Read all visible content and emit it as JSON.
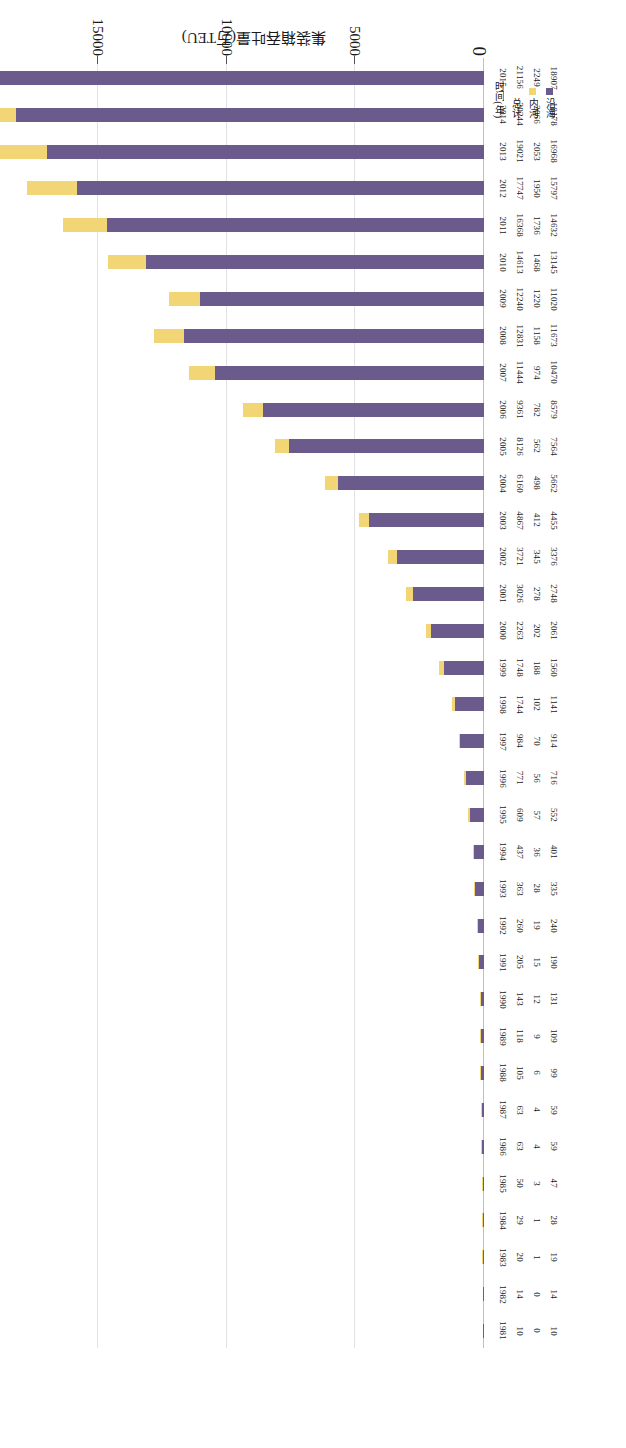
{
  "chart_data": {
    "type": "bar",
    "orientation": "horizontal-stacked",
    "title": "",
    "xlabel": "集装箱吞吐量(万TEU)",
    "ylabel": "时间(年)",
    "xlim": [
      0,
      22000
    ],
    "ticks": [
      "0",
      "5000",
      "10000",
      "15000",
      "20000"
    ],
    "tick_values": [
      0,
      5000,
      10000,
      15000,
      20000
    ],
    "grid": true,
    "legend_position": "bottom-left",
    "categories": [
      "1981",
      "1982",
      "1983",
      "1984",
      "1985",
      "1986",
      "1987",
      "1988",
      "1989",
      "1990",
      "1991",
      "1992",
      "1993",
      "1994",
      "1995",
      "1996",
      "1997",
      "1998",
      "1999",
      "2000",
      "2001",
      "2002",
      "2003",
      "2004",
      "2005",
      "2006",
      "2007",
      "2008",
      "2009",
      "2010",
      "2011",
      "2012",
      "2013",
      "2014",
      "2015"
    ],
    "series": [
      {
        "name": "内河",
        "color": "#f2d675",
        "values": [
          0,
          0,
          1,
          1,
          3,
          4,
          4,
          6,
          9,
          12,
          15,
          19,
          28,
          36,
          57,
          56,
          70,
          102,
          188,
          202,
          278,
          345,
          412,
          498,
          562,
          782,
          974,
          1158,
          1220,
          1468,
          1736,
          1950,
          2053,
          2066,
          2249
        ]
      },
      {
        "name": "沿海",
        "color": "#6b5b8c",
        "values": [
          10,
          14,
          19,
          28,
          47,
          59,
          59,
          99,
          109,
          131,
          190,
          240,
          335,
          401,
          552,
          716,
          914,
          1141,
          1560,
          2061,
          2748,
          3376,
          4455,
          5662,
          7564,
          8579,
          10470,
          11673,
          11020,
          13145,
          14632,
          15797,
          16968,
          18178,
          18907
        ]
      }
    ],
    "totals": [
      10,
      14,
      20,
      29,
      50,
      63,
      63,
      105,
      118,
      143,
      205,
      260,
      363,
      437,
      609,
      771,
      984,
      1744,
      1748,
      2263,
      3026,
      3721,
      4867,
      6160,
      8126,
      9361,
      11444,
      12831,
      12240,
      14613,
      16368,
      17747,
      19021,
      20244,
      21156
    ]
  },
  "row_headers": {
    "time": "时间(年)",
    "total": "总计",
    "inland": "内河",
    "coastal": "沿海"
  },
  "legend": [
    {
      "label": "内河",
      "color": "#f2d675"
    },
    {
      "label": "沿海",
      "color": "#6b5b8c"
    }
  ],
  "axis_title": "集装箱吞吐量(万TEU)",
  "zero_label": "0"
}
